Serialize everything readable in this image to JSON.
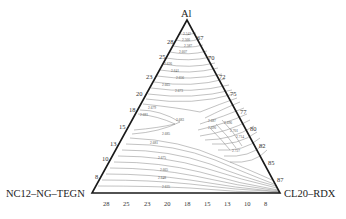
{
  "diagram": {
    "type": "ternary-contour",
    "vertices": {
      "top": "Al",
      "bottom_left": "NC12–NG–TEGN",
      "bottom_right": "CL20–RDX"
    },
    "left_axis_ticks": [
      "28",
      "25",
      "23",
      "20",
      "18",
      "15",
      "13",
      "10",
      "8"
    ],
    "right_axis_ticks": [
      "67",
      "70",
      "72",
      "75",
      "77",
      "80",
      "82",
      "85",
      "87"
    ],
    "bottom_axis_ticks": [
      "28",
      "25",
      "23",
      "20",
      "18",
      "15",
      "13",
      "10",
      "8"
    ],
    "contour_labels": [
      "2.542",
      "2.566",
      "2.587",
      "2.607",
      "2.626",
      "2.641",
      "2.656",
      "2.665",
      "2.673",
      "2.679",
      "2.681",
      "2.683",
      "2.685",
      "2.687",
      "2.690",
      "2.696",
      "2.701",
      "2.714",
      "2.727",
      "2.681",
      "2.675",
      "2.665",
      "2.648",
      "2.635"
    ],
    "colors": {
      "line": "#1a1a1a",
      "contour": "#666666",
      "text": "#222222"
    }
  }
}
